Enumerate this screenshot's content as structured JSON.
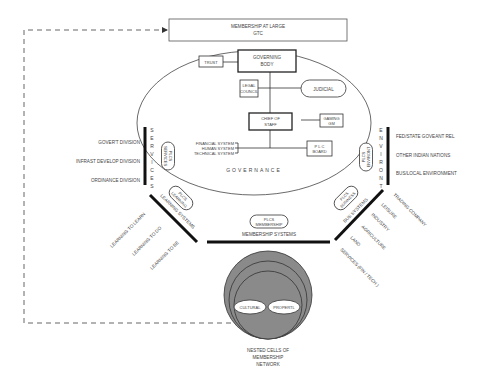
{
  "top_box": {
    "line1": "MEMBERSHIP AT LARGE",
    "line2": "GTC"
  },
  "governance": {
    "label": "GOVERNANCE",
    "trust": "TRUST",
    "governing_body": [
      "GOVERNING",
      "BODY"
    ],
    "legal_council": [
      "LEGAL",
      "COUNCIL"
    ],
    "judicial": "JUDICIAL",
    "chief_of_staff": [
      "CHIEF OF",
      "STAFF"
    ],
    "gaming": [
      "GAMING",
      "GM"
    ],
    "plc_board": [
      "P L C",
      "BOARD"
    ],
    "systems": [
      "FINANCIAL SYSTEM",
      "HUMAN SYSTEM",
      "TECHNICAL SYSTEM"
    ]
  },
  "services": {
    "vertical_label": [
      "S",
      "E",
      "R",
      "V",
      "I",
      "C",
      "E",
      "S"
    ],
    "pill": [
      "PLCS",
      "SERVICES"
    ],
    "items": [
      "GOVER'T DIVISION",
      "INFRAST DEVELOP DIVISION",
      "ORDINANCE DIVISION"
    ]
  },
  "environment": {
    "vertical_label": [
      "E",
      "N",
      "V",
      "I",
      "R",
      "O",
      "N",
      "T"
    ],
    "pill": [
      "PLCS",
      "ENVIRONT"
    ],
    "items": [
      "FED/STATE GOVEANT REL",
      "OTHER INDIAN NATIONS",
      "BUS/LOCAL ENVIRONMENT"
    ]
  },
  "learning": {
    "pill": [
      "PLCS",
      "LEARNING"
    ],
    "label": "LEARNING SYSTEMS",
    "items": [
      "LEARNING TO LEARN",
      "LEARNING TO DO",
      "LEARNING TO BE"
    ]
  },
  "business": {
    "pill": [
      "PLCS",
      "BUSINESS"
    ],
    "label": "BUS SYSTEMS",
    "items": [
      "TRADING COMPANY",
      "LEISURE",
      "INDUSTRY",
      "AGRICULTURE",
      "LAND",
      "SERVICES (FIN / TECH )"
    ]
  },
  "membership": {
    "pill": [
      "PLCS",
      "MEMBERSHIP"
    ],
    "label": "MEMBERSHIP SYSTEMS"
  },
  "nested": {
    "left": "CULTURAL",
    "right": "PROPERTL",
    "caption": [
      "NESTED CELLS OF",
      "MEMBERSHIP",
      "NETWORK"
    ]
  },
  "colors": {
    "line": "#222222",
    "circle_fill": "#8a8a8a",
    "circle_stroke": "#333333",
    "text": "#444444"
  }
}
